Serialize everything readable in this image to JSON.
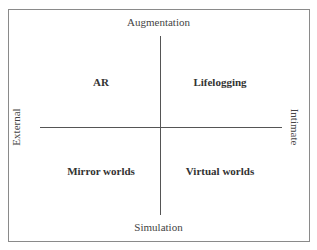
{
  "diagram": {
    "axes": {
      "top": "Augmentation",
      "bottom": "Simulation",
      "left": "External",
      "right": "Intimate"
    },
    "quadrants": {
      "top_left": "AR",
      "top_right": "Lifelogging",
      "bottom_left": "Mirror worlds",
      "bottom_right": "Virtual worlds"
    }
  }
}
